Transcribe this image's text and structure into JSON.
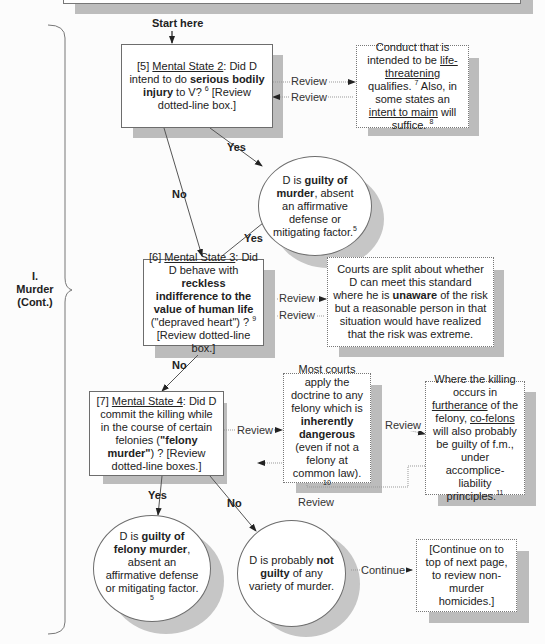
{
  "section": {
    "numeral": "I.",
    "title": "Murder",
    "subtitle": "(Cont.)"
  },
  "start_label": "Start here",
  "nodes": {
    "ms2": {
      "num": "[5]",
      "heading": "Mental State 2",
      "pre": ": Did D intend to do ",
      "bold": "serious bodily injury",
      "post": " to V? ",
      "fn": "6",
      "tail": " [Review dotted-line box.]"
    },
    "ms2_note": {
      "a": "Conduct that is intended to be ",
      "u1": "life-threatening",
      "b": " qualifies. ",
      "fn1": "7",
      "c": " Also, in some states an ",
      "u2": "intent to maim",
      "d": " will suffice. ",
      "fn2": "8"
    },
    "guilty_murder": {
      "pre": "D is ",
      "bold": "guilty of murder",
      "post": ", absent an affirmative defense or mitigating factor.",
      "fn": "5"
    },
    "ms3": {
      "num": "[6]",
      "heading": "Mental State 3",
      "pre": ": Did D behave with ",
      "bold": "reckless indifference to the value of human life",
      "post": " (\"depraved heart\") ? ",
      "fn": "9",
      "tail": " [Review dotted-line box.]"
    },
    "ms3_note": {
      "a": "Courts are split about whether D can meet this standard where he is ",
      "bold": "unaware",
      "b": " of the risk but a reasonable person in that situation would have realized that the risk was extreme."
    },
    "ms4": {
      "num": "[7]",
      "heading": "Mental State 4",
      "pre": ": Did D commit the killing while in the course of certain felonies  (",
      "bold": "\"felony murder\"",
      "post": ") ? [Review dotted-line boxes.]"
    },
    "ms4_note1": {
      "a": "Most courts apply the doctrine to any felony which is ",
      "bold": "inherently dangerous",
      "b": " (even if not a felony at common law). ",
      "fn": "10"
    },
    "ms4_note2": {
      "a": "Where the killing occurs in ",
      "u1": "furtherance",
      "b": " of the felony, ",
      "u2": "co-felons",
      "c": " will also probably be guilty of f.m., under accomplice-liability principles.",
      "fn": "11"
    },
    "guilty_felony": {
      "pre": "D is ",
      "bold": "guilty of felony murder",
      "post": ", absent an affirmative defense or mitigating factor. ",
      "fn": "5"
    },
    "not_guilty": {
      "pre": "D is probably ",
      "bold": "not guilty",
      "post": " of any variety of murder."
    },
    "continue_box": {
      "text": "[Continue on to top of next page, to review non-murder homicides.]"
    }
  },
  "edges": {
    "yes": "Yes",
    "no": "No",
    "review": "Review",
    "continue": "Continue"
  }
}
